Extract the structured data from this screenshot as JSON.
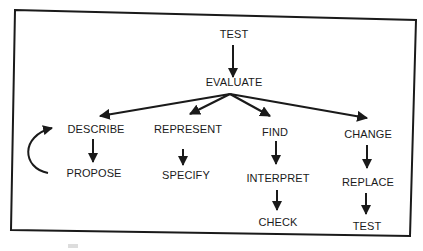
{
  "diagram": {
    "nodes": {
      "test_top": "TEST",
      "evaluate": "EVALUATE",
      "describe": "DESCRIBE",
      "propose": "PROPOSE",
      "represent": "REPRESENT",
      "specify": "SPECIFY",
      "find": "FIND",
      "interpret": "INTERPRET",
      "check": "CHECK",
      "change": "CHANGE",
      "replace": "REPLACE",
      "test_bottom": "TEST"
    },
    "edges": [
      [
        "TEST",
        "EVALUATE"
      ],
      [
        "EVALUATE",
        "DESCRIBE"
      ],
      [
        "EVALUATE",
        "REPRESENT"
      ],
      [
        "EVALUATE",
        "FIND"
      ],
      [
        "EVALUATE",
        "CHANGE"
      ],
      [
        "DESCRIBE",
        "PROPOSE"
      ],
      [
        "PROPOSE",
        "DESCRIBE"
      ],
      [
        "REPRESENT",
        "SPECIFY"
      ],
      [
        "FIND",
        "INTERPRET"
      ],
      [
        "INTERPRET",
        "CHECK"
      ],
      [
        "CHANGE",
        "REPLACE"
      ],
      [
        "REPLACE",
        "TEST"
      ]
    ],
    "colors": {
      "ink": "#1a1a1a",
      "paper": "#ffffff"
    }
  }
}
